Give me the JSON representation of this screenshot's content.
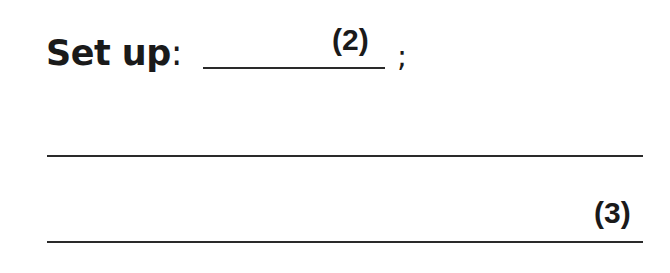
{
  "prompt": {
    "label": "Set up",
    "colon": ":",
    "blank_mark": "(2)",
    "terminator": ";"
  },
  "answer_lines": {
    "count": 2,
    "mark": "(3)"
  }
}
